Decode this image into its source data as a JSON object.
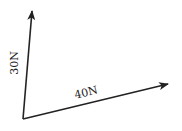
{
  "diagram": {
    "type": "force-vectors",
    "origin": {
      "x": 23,
      "y": 119
    },
    "colors": {
      "line": "#222222",
      "background": "#ffffff"
    },
    "vectors": [
      {
        "label": "30N",
        "magnitude": 30,
        "unit": "N",
        "tip": {
          "x": 32,
          "y": 10
        }
      },
      {
        "label": "40N",
        "magnitude": 40,
        "unit": "N",
        "tip": {
          "x": 169,
          "y": 84
        }
      }
    ]
  }
}
